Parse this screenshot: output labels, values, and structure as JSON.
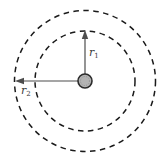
{
  "diagram": {
    "type": "concentric-dashed-circles",
    "labels": {
      "inner_radius": {
        "base": "r",
        "sub": "1"
      },
      "outer_radius": {
        "base": "r",
        "sub": "2"
      }
    },
    "colors": {
      "background": "#ffffff",
      "dashed_circle": "#1a1a1a",
      "arrow": "#4d4d4d",
      "particle_fill": "#b3b3b3",
      "particle_border": "#2b2b2b"
    }
  }
}
